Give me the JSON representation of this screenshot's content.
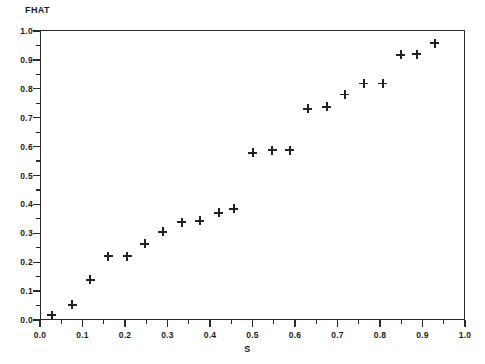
{
  "chart_data": {
    "type": "scatter",
    "title": "",
    "ylabel": "FHAT",
    "xlabel": "S",
    "xlim": [
      0.0,
      1.0
    ],
    "ylim": [
      0.0,
      1.0
    ],
    "grid": false,
    "legend": null,
    "marker": "plus",
    "marker_color": "#222222",
    "x_ticks": [
      "0.0",
      "0.1",
      "0.2",
      "0.3",
      "0.4",
      "0.5",
      "0.6",
      "0.7",
      "0.8",
      "0.9",
      "1.0"
    ],
    "x_tick_values": [
      0.0,
      0.1,
      0.2,
      0.3,
      0.4,
      0.5,
      0.6,
      0.7,
      0.8,
      0.9,
      1.0
    ],
    "y_ticks": [
      "0.0",
      "0.1",
      "0.2",
      "0.3",
      "0.4",
      "0.5",
      "0.6",
      "0.7",
      "0.8",
      "0.9",
      "1.0"
    ],
    "y_tick_values": [
      0.0,
      0.1,
      0.2,
      0.3,
      0.4,
      0.5,
      0.6,
      0.7,
      0.8,
      0.9,
      1.0
    ],
    "x_minor_ticks": [
      0.05,
      0.15,
      0.25,
      0.35,
      0.45,
      0.55,
      0.65,
      0.75,
      0.85,
      0.95
    ],
    "y_minor_ticks": [
      0.05,
      0.15,
      0.25,
      0.35,
      0.45,
      0.55,
      0.65,
      0.75,
      0.85,
      0.95
    ],
    "x": [
      0.028,
      0.076,
      0.118,
      0.16,
      0.205,
      0.247,
      0.289,
      0.334,
      0.376,
      0.421,
      0.456,
      0.501,
      0.546,
      0.588,
      0.63,
      0.675,
      0.717,
      0.762,
      0.807,
      0.849,
      0.887,
      0.929
    ],
    "y": [
      0.017,
      0.052,
      0.139,
      0.221,
      0.221,
      0.263,
      0.305,
      0.339,
      0.343,
      0.371,
      0.385,
      0.578,
      0.588,
      0.588,
      0.731,
      0.738,
      0.78,
      0.818,
      0.818,
      0.918,
      0.92,
      0.958
    ],
    "points": [
      {
        "x": 0.028,
        "y": 0.017
      },
      {
        "x": 0.076,
        "y": 0.052
      },
      {
        "x": 0.118,
        "y": 0.139
      },
      {
        "x": 0.16,
        "y": 0.221
      },
      {
        "x": 0.205,
        "y": 0.221
      },
      {
        "x": 0.247,
        "y": 0.263
      },
      {
        "x": 0.289,
        "y": 0.305
      },
      {
        "x": 0.334,
        "y": 0.339
      },
      {
        "x": 0.376,
        "y": 0.343
      },
      {
        "x": 0.421,
        "y": 0.371
      },
      {
        "x": 0.456,
        "y": 0.385
      },
      {
        "x": 0.501,
        "y": 0.578
      },
      {
        "x": 0.546,
        "y": 0.588
      },
      {
        "x": 0.588,
        "y": 0.588
      },
      {
        "x": 0.63,
        "y": 0.731
      },
      {
        "x": 0.675,
        "y": 0.738
      },
      {
        "x": 0.717,
        "y": 0.78
      },
      {
        "x": 0.762,
        "y": 0.818
      },
      {
        "x": 0.807,
        "y": 0.818
      },
      {
        "x": 0.849,
        "y": 0.918
      },
      {
        "x": 0.887,
        "y": 0.92
      },
      {
        "x": 0.929,
        "y": 0.958
      }
    ]
  }
}
